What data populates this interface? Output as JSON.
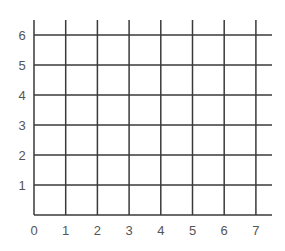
{
  "chart_data": {
    "type": "scatter",
    "title": "",
    "xlabel": "",
    "ylabel": "",
    "xlim": [
      0,
      7
    ],
    "ylim": [
      0,
      6
    ],
    "x_ticks": [
      "0",
      "1",
      "2",
      "3",
      "4",
      "5",
      "6",
      "7"
    ],
    "y_ticks": [
      "1",
      "2",
      "3",
      "4",
      "5",
      "6"
    ],
    "grid": true,
    "legend": null,
    "series": []
  },
  "colors": {
    "grid_line": "#3a3a3a",
    "label": "#555555",
    "background": "#ffffff"
  }
}
